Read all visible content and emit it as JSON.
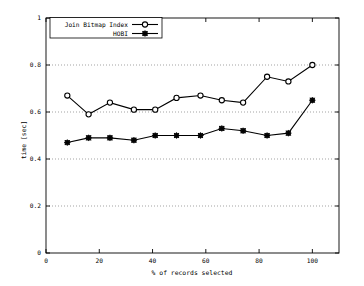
{
  "chart_data": {
    "type": "line",
    "title": "",
    "xlabel": "% of records selected",
    "ylabel": "time [sec]",
    "xlim": [
      0,
      110
    ],
    "ylim": [
      0,
      1
    ],
    "xticks": [
      "0",
      "20",
      "40",
      "60",
      "80",
      "100"
    ],
    "xtick_values": [
      0,
      20,
      40,
      60,
      80,
      100
    ],
    "yticks": [
      "0",
      "0.2",
      "0.4",
      "0.6",
      "0.8",
      "1"
    ],
    "ytick_values": [
      0,
      0.2,
      0.4,
      0.6,
      0.8,
      1
    ],
    "grid": true,
    "grid_axis": "y",
    "legend_position": "top-left",
    "x": [
      8,
      16,
      24,
      33,
      41,
      49,
      58,
      66,
      74,
      83,
      91,
      100
    ],
    "series": [
      {
        "name": "Join Bitmap Index",
        "marker": "circle",
        "color": "#000000",
        "values": [
          0.67,
          0.59,
          0.64,
          0.61,
          0.61,
          0.66,
          0.67,
          0.65,
          0.64,
          0.75,
          0.73,
          0.8
        ]
      },
      {
        "name": "HOBI",
        "marker": "star",
        "color": "#000000",
        "values": [
          0.47,
          0.49,
          0.49,
          0.48,
          0.5,
          0.5,
          0.5,
          0.53,
          0.52,
          0.5,
          0.51,
          0.65
        ]
      }
    ]
  },
  "legend": {
    "entries": [
      {
        "label": "Join Bitmap Index",
        "marker": "circle-marker-icon"
      },
      {
        "label": "HOBI",
        "marker": "star-marker-icon"
      }
    ]
  },
  "axes": {
    "x_title": "% of records selected",
    "y_title": "time [sec]"
  }
}
